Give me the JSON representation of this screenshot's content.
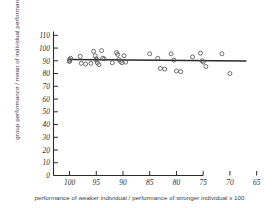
{
  "figure": {
    "ylabel": "group performance / mean of individual performance x 100",
    "xlabel": "performance of weaker individual / performance of stronger individual x 100",
    "marker_style": "open-circle",
    "line_color": "#2b2b2b",
    "marker_color": "#555555"
  },
  "chart_data": {
    "type": "scatter",
    "title": "",
    "xlabel": "performance of weaker individual / performance of stronger individual x 100",
    "ylabel": "group performance / mean of individual performance x 100",
    "xlim": [
      103,
      64
    ],
    "ylim": [
      0,
      113
    ],
    "x_reversed": true,
    "grid": false,
    "legend": null,
    "xticks": [
      100,
      95,
      90,
      85,
      80,
      75,
      70,
      65
    ],
    "xtick_labels": [
      "100",
      "95",
      "90",
      "85",
      "80",
      "75",
      "70",
      "65"
    ],
    "yticks": [
      0,
      10,
      20,
      30,
      40,
      50,
      60,
      70,
      80,
      90,
      100,
      110
    ],
    "ytick_labels": [
      "0",
      "10",
      "20",
      "30",
      "40",
      "50",
      "60",
      "70",
      "80",
      "90",
      "100",
      "110"
    ],
    "points": [
      {
        "x": 100.0,
        "y": 91.0
      },
      {
        "x": 100.0,
        "y": 90.0
      },
      {
        "x": 100.0,
        "y": 89.5
      },
      {
        "x": 99.8,
        "y": 92.0
      },
      {
        "x": 98.0,
        "y": 93.5
      },
      {
        "x": 97.8,
        "y": 88.0
      },
      {
        "x": 97.0,
        "y": 87.5
      },
      {
        "x": 96.0,
        "y": 88.0
      },
      {
        "x": 95.5,
        "y": 97.5
      },
      {
        "x": 95.2,
        "y": 94.0
      },
      {
        "x": 95.0,
        "y": 91.5
      },
      {
        "x": 95.0,
        "y": 90.5
      },
      {
        "x": 94.8,
        "y": 88.5
      },
      {
        "x": 94.5,
        "y": 87.0
      },
      {
        "x": 94.0,
        "y": 98.0
      },
      {
        "x": 93.8,
        "y": 92.0
      },
      {
        "x": 93.5,
        "y": 91.5
      },
      {
        "x": 92.0,
        "y": 88.5
      },
      {
        "x": 91.2,
        "y": 96.5
      },
      {
        "x": 91.0,
        "y": 95.0
      },
      {
        "x": 90.8,
        "y": 91.0
      },
      {
        "x": 90.5,
        "y": 89.5
      },
      {
        "x": 90.2,
        "y": 88.5
      },
      {
        "x": 89.8,
        "y": 94.0
      },
      {
        "x": 89.5,
        "y": 89.0
      },
      {
        "x": 85.0,
        "y": 95.5
      },
      {
        "x": 83.5,
        "y": 92.0
      },
      {
        "x": 83.0,
        "y": 84.0
      },
      {
        "x": 82.2,
        "y": 83.5
      },
      {
        "x": 81.0,
        "y": 95.5
      },
      {
        "x": 80.5,
        "y": 90.5
      },
      {
        "x": 80.0,
        "y": 82.0
      },
      {
        "x": 79.2,
        "y": 81.5
      },
      {
        "x": 77.0,
        "y": 93.0
      },
      {
        "x": 75.5,
        "y": 96.0
      },
      {
        "x": 75.2,
        "y": 90.0
      },
      {
        "x": 75.0,
        "y": 89.0
      },
      {
        "x": 74.5,
        "y": 85.5
      },
      {
        "x": 71.5,
        "y": 95.5
      },
      {
        "x": 70.0,
        "y": 80.0
      }
    ],
    "trend_line": {
      "type": "linear-fit",
      "x_start": 100.0,
      "y_start": 91.0,
      "x_end": 67.0,
      "y_end": 89.8
    }
  }
}
